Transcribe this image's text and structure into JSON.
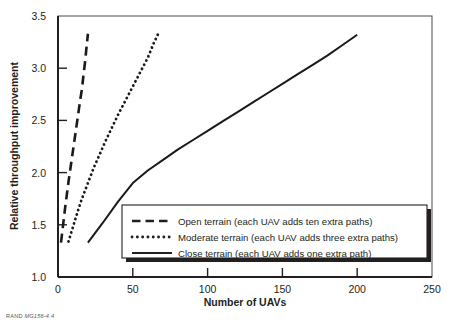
{
  "figure": {
    "source_note_prefix": "RAND",
    "source_note_id": "MG156-4.4"
  },
  "chart_data": {
    "type": "line",
    "title": "",
    "xlabel": "Number of UAVs",
    "ylabel": "Relative throughput improvement",
    "xlim": [
      0,
      250
    ],
    "ylim": [
      1.0,
      3.5
    ],
    "xticks": [
      0,
      50,
      100,
      150,
      200,
      250
    ],
    "yticks": [
      1.0,
      1.5,
      2.0,
      2.5,
      3.0,
      3.5
    ],
    "xtick_labels": [
      "0",
      "50",
      "100",
      "150",
      "200",
      "250"
    ],
    "ytick_labels": [
      "1.0",
      "1.5",
      "2.0",
      "2.5",
      "3.0",
      "3.5"
    ],
    "grid": false,
    "legend_position": "lower-right-inside",
    "series": [
      {
        "name": "Open terrain (each UAV adds ten extra paths)",
        "style": "dashed",
        "color": "#1a1a1a",
        "x": [
          2,
          3,
          4,
          5,
          6,
          7,
          8,
          9,
          10,
          11,
          12,
          13,
          14,
          15,
          16,
          17,
          18,
          19,
          20
        ],
        "y": [
          1.33,
          1.45,
          1.57,
          1.69,
          1.8,
          1.91,
          2.01,
          2.11,
          2.21,
          2.31,
          2.41,
          2.51,
          2.61,
          2.71,
          2.8,
          2.93,
          3.05,
          3.19,
          3.33
        ]
      },
      {
        "name": "Moderate terrain (each UAV adds three extra paths)",
        "style": "dotted",
        "color": "#1a1a1a",
        "x": [
          7,
          10,
          13,
          16,
          20,
          24,
          28,
          32,
          36,
          40,
          44,
          48,
          52,
          56,
          60,
          64,
          67
        ],
        "y": [
          1.34,
          1.48,
          1.62,
          1.75,
          1.9,
          2.05,
          2.18,
          2.31,
          2.43,
          2.55,
          2.66,
          2.77,
          2.88,
          2.99,
          3.1,
          3.24,
          3.33
        ]
      },
      {
        "name": "Close terrain (each UAV adds one extra path)",
        "style": "solid",
        "color": "#1a1a1a",
        "x": [
          20,
          30,
          40,
          50,
          60,
          70,
          80,
          90,
          100,
          110,
          120,
          130,
          140,
          150,
          160,
          170,
          180,
          190,
          200
        ],
        "y": [
          1.33,
          1.52,
          1.72,
          1.9,
          2.02,
          2.12,
          2.22,
          2.31,
          2.4,
          2.49,
          2.58,
          2.67,
          2.76,
          2.85,
          2.94,
          3.03,
          3.12,
          3.22,
          3.32
        ]
      }
    ],
    "legend_entries": [
      {
        "label": "Open terrain (each UAV adds ten extra paths)",
        "style": "dashed"
      },
      {
        "label": "Moderate terrain (each UAV adds three extra paths)",
        "style": "dotted"
      },
      {
        "label": "Close terrain (each UAV adds one extra path)",
        "style": "solid"
      }
    ]
  }
}
